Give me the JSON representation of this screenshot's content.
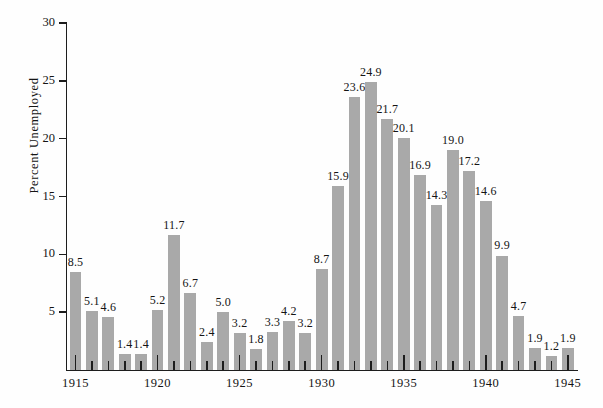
{
  "chart_data": {
    "type": "bar",
    "title": "",
    "xlabel": "",
    "ylabel": "Percent Unemployed",
    "ylim": [
      0,
      30
    ],
    "ytick_labels": [
      "30",
      "25",
      "20",
      "15",
      "10",
      "5"
    ],
    "ytick_values": [
      30,
      25,
      20,
      15,
      10,
      5
    ],
    "xtick_major_labels": [
      "1915",
      "1920",
      "1925",
      "1930",
      "1935",
      "1940",
      "1945"
    ],
    "xtick_major_values": [
      1915,
      1920,
      1925,
      1930,
      1935,
      1940,
      1945
    ],
    "grid": false,
    "legend": "none",
    "bar_color": "#a9a9a9",
    "axis_color": "#1d1d1d",
    "background_color": "#fefefe",
    "categories": [
      "1915",
      "1916",
      "1917",
      "1918",
      "1919",
      "1920",
      "1921",
      "1922",
      "1923",
      "1924",
      "1925",
      "1926",
      "1927",
      "1928",
      "1929",
      "1930",
      "1931",
      "1932",
      "1933",
      "1934",
      "1935",
      "1936",
      "1937",
      "1938",
      "1939",
      "1940",
      "1941",
      "1942",
      "1943",
      "1944",
      "1945"
    ],
    "values": [
      8.5,
      5.1,
      4.6,
      1.4,
      1.4,
      5.2,
      11.7,
      6.7,
      2.4,
      5.0,
      3.2,
      1.8,
      3.3,
      4.2,
      3.2,
      8.7,
      15.9,
      23.6,
      24.9,
      21.7,
      20.1,
      16.9,
      14.3,
      19.0,
      17.2,
      14.6,
      9.9,
      4.7,
      1.9,
      1.2,
      1.9
    ],
    "value_labels": [
      "8.5",
      "5.1",
      "4.6",
      "1.4",
      "1.4",
      "5.2",
      "11.7",
      "6.7",
      "2.4",
      "5.0",
      "3.2",
      "1.8",
      "3.3",
      "4.2",
      "3.2",
      "8.7",
      "15.9",
      "23.6",
      "24.9",
      "21.7",
      "20.1",
      "16.9",
      "14.3",
      "19.0",
      "17.2",
      "14.6",
      "9.9",
      "4.7",
      "1.9",
      "1.2",
      "1.9"
    ]
  }
}
